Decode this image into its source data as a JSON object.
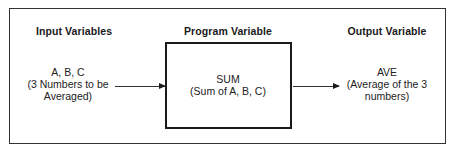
{
  "diagram": {
    "columns": [
      {
        "heading": "Input Variables",
        "lines": [
          "A, B, C",
          "(3 Numbers to be",
          "Averaged)"
        ]
      },
      {
        "heading": "Program Variable",
        "lines": [
          "SUM",
          "(Sum of A, B, C)"
        ]
      },
      {
        "heading": "Output Variable",
        "lines": [
          "AVE",
          "(Average of the 3",
          "numbers)"
        ]
      }
    ],
    "arrows": [
      {
        "from": "Input Variables",
        "to": "Program Variable"
      },
      {
        "from": "Program Variable",
        "to": "Output Variable"
      }
    ],
    "colors": {
      "line": "#1a1a1a",
      "background": "#ffffff"
    }
  }
}
